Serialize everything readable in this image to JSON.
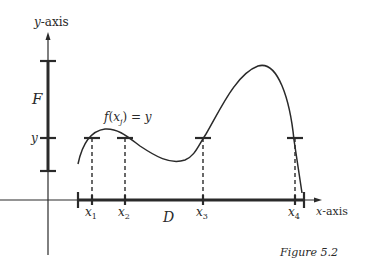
{
  "figure": {
    "caption": "Figure 5.2",
    "axes": {
      "y_label_var": "y",
      "y_label_suffix": "-axis",
      "x_label_var": "x",
      "x_label_suffix": "-axis"
    },
    "sets": {
      "codomain_label": "F",
      "domain_label": "D"
    },
    "function_label": {
      "f": "f",
      "open": "(",
      "x": "x",
      "sub": "j",
      "close": ") = ",
      "y": "y"
    },
    "y_tick_label": "y",
    "x_points": [
      {
        "var": "x",
        "sub": "1"
      },
      {
        "var": "x",
        "sub": "2"
      },
      {
        "var": "x",
        "sub": "3"
      },
      {
        "var": "x",
        "sub": "4"
      }
    ],
    "colors": {
      "ink": "#2a2a2a",
      "background": "#ffffff"
    }
  }
}
